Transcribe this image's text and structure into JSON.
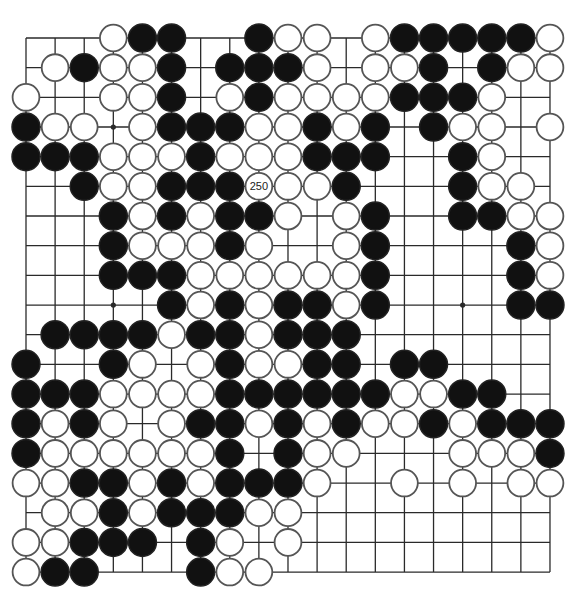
{
  "diagram": {
    "type": "go-board",
    "board_size": 19,
    "grid": {
      "origin_x": 26,
      "origin_y": 38,
      "spacing_x": 29.11,
      "spacing_y": 29.67,
      "stone_radius": 14
    },
    "colors": {
      "background": "#ffffff",
      "line": "#2a2a2a",
      "black_stone": "#111111",
      "white_stone": "#ffffff",
      "white_stone_border": "#555555"
    },
    "hoshi": [
      [
        3,
        3
      ],
      [
        9,
        3
      ],
      [
        15,
        3
      ],
      [
        3,
        9
      ],
      [
        9,
        9
      ],
      [
        15,
        9
      ],
      [
        3,
        15
      ],
      [
        9,
        15
      ],
      [
        15,
        15
      ]
    ],
    "labeled_stones": [
      {
        "col": 8,
        "row": 5,
        "color": "white",
        "label": "250"
      }
    ],
    "rows": [
      {
        "row": 0,
        "black": [
          4,
          5,
          8,
          13,
          14,
          15,
          16,
          17
        ],
        "white": [
          3,
          9,
          10,
          12,
          18
        ]
      },
      {
        "row": 1,
        "black": [
          2,
          5,
          7,
          8,
          9,
          14,
          16
        ],
        "white": [
          1,
          3,
          4,
          10,
          12,
          13,
          17,
          18
        ]
      },
      {
        "row": 2,
        "black": [
          5,
          8,
          13,
          14,
          15
        ],
        "white": [
          0,
          3,
          4,
          7,
          9,
          10,
          11,
          12,
          16
        ]
      },
      {
        "row": 3,
        "black": [
          0,
          5,
          6,
          7,
          10,
          12,
          14
        ],
        "white": [
          1,
          2,
          4,
          8,
          9,
          11,
          15,
          16,
          18
        ]
      },
      {
        "row": 4,
        "black": [
          0,
          1,
          2,
          6,
          10,
          11,
          12,
          15
        ],
        "white": [
          3,
          4,
          5,
          7,
          8,
          9,
          16
        ]
      },
      {
        "row": 5,
        "black": [
          2,
          5,
          6,
          7,
          11,
          15
        ],
        "white": [
          3,
          4,
          9,
          10,
          16,
          17
        ]
      },
      {
        "row": 6,
        "black": [
          3,
          5,
          7,
          8,
          12,
          15,
          16
        ],
        "white": [
          4,
          6,
          9,
          11,
          17,
          18
        ]
      },
      {
        "row": 7,
        "black": [
          3,
          7,
          12,
          17
        ],
        "white": [
          4,
          5,
          6,
          8,
          11,
          18
        ]
      },
      {
        "row": 8,
        "black": [
          3,
          4,
          5,
          12,
          17
        ],
        "white": [
          6,
          7,
          8,
          9,
          10,
          11,
          18
        ]
      },
      {
        "row": 9,
        "black": [
          5,
          7,
          9,
          10,
          12,
          17,
          18
        ],
        "white": [
          6,
          8,
          11
        ]
      },
      {
        "row": 10,
        "black": [
          1,
          2,
          3,
          4,
          6,
          7,
          9,
          10,
          11
        ],
        "white": [
          5,
          8
        ]
      },
      {
        "row": 11,
        "black": [
          0,
          3,
          7,
          10,
          11,
          13,
          14
        ],
        "white": [
          4,
          6,
          8,
          9
        ]
      },
      {
        "row": 12,
        "black": [
          0,
          1,
          2,
          7,
          8,
          9,
          10,
          11,
          12,
          15,
          16
        ],
        "white": [
          3,
          4,
          5,
          6,
          13,
          14
        ]
      },
      {
        "row": 13,
        "black": [
          0,
          2,
          6,
          7,
          9,
          11,
          14,
          16,
          17,
          18
        ],
        "white": [
          1,
          3,
          5,
          8,
          10,
          12,
          13,
          15
        ]
      },
      {
        "row": 14,
        "black": [
          0,
          7,
          9,
          18
        ],
        "white": [
          1,
          2,
          3,
          4,
          5,
          6,
          10,
          11,
          15,
          16,
          17
        ]
      },
      {
        "row": 15,
        "black": [
          2,
          3,
          5,
          7,
          8,
          9
        ],
        "white": [
          0,
          1,
          4,
          6,
          10,
          13,
          15,
          17,
          18
        ]
      },
      {
        "row": 16,
        "black": [
          3,
          5,
          6,
          7
        ],
        "white": [
          1,
          2,
          4,
          8,
          9
        ]
      },
      {
        "row": 17,
        "black": [
          2,
          3,
          4,
          6
        ],
        "white": [
          0,
          1,
          7,
          9
        ]
      },
      {
        "row": 18,
        "black": [
          1,
          2,
          6
        ],
        "white": [
          0,
          7,
          8
        ]
      }
    ]
  }
}
